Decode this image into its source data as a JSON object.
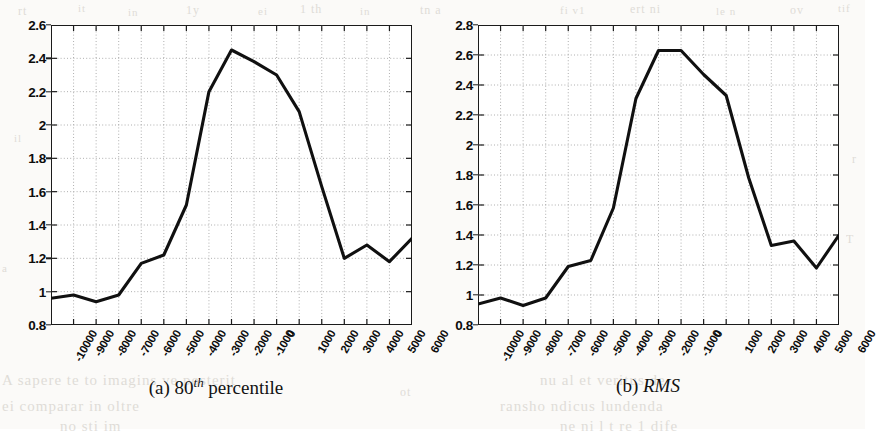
{
  "page": {
    "background_color": "#fbfaf8",
    "ink_color": "#1b1b1b",
    "grid_color": "#9a9a9a"
  },
  "ghost_text": [
    {
      "text": "rt",
      "x": 18,
      "y": 4,
      "size": 12
    },
    {
      "text": "it",
      "x": 78,
      "y": 2,
      "size": 11
    },
    {
      "text": "in",
      "x": 128,
      "y": 6,
      "size": 11
    },
    {
      "text": "1y",
      "x": 186,
      "y": 3,
      "size": 12
    },
    {
      "text": "ei",
      "x": 258,
      "y": 5,
      "size": 11
    },
    {
      "text": "1 th",
      "x": 300,
      "y": 2,
      "size": 12
    },
    {
      "text": "in",
      "x": 360,
      "y": 5,
      "size": 11
    },
    {
      "text": "tn a",
      "x": 420,
      "y": 3,
      "size": 12
    },
    {
      "text": "fi v1",
      "x": 560,
      "y": 4,
      "size": 11
    },
    {
      "text": "ert ni",
      "x": 630,
      "y": 2,
      "size": 12
    },
    {
      "text": "le n",
      "x": 716,
      "y": 5,
      "size": 11
    },
    {
      "text": "ov",
      "x": 790,
      "y": 3,
      "size": 12
    },
    {
      "text": "tif",
      "x": 838,
      "y": 2,
      "size": 11
    },
    {
      "text": "il",
      "x": 14,
      "y": 132,
      "size": 11
    },
    {
      "text": "1",
      "x": 336,
      "y": 120,
      "size": 11
    },
    {
      "text": "r",
      "x": 852,
      "y": 152,
      "size": 12
    },
    {
      "text": "1",
      "x": 592,
      "y": 122,
      "size": 11
    },
    {
      "text": "T",
      "x": 846,
      "y": 232,
      "size": 12
    },
    {
      "text": "a",
      "x": 2,
      "y": 262,
      "size": 11
    },
    {
      "text": "ot",
      "x": 400,
      "y": 385,
      "size": 12
    },
    {
      "text": "A sapere te to imagins ve posterit",
      "x": 2,
      "y": 372,
      "size": 15
    },
    {
      "text": "ei comparar in oltre",
      "x": 2,
      "y": 398,
      "size": 15
    },
    {
      "text": "nu al et veritus de",
      "x": 540,
      "y": 372,
      "size": 15
    },
    {
      "text": "ransho ndicus lundenda",
      "x": 500,
      "y": 398,
      "size": 15
    },
    {
      "text": "ne ni l t re 1 dife",
      "x": 560,
      "y": 418,
      "size": 15
    },
    {
      "text": "no sti im",
      "x": 60,
      "y": 418,
      "size": 15
    }
  ],
  "subfigures": [
    {
      "id": "a",
      "caption_prefix": "(a)",
      "caption_main": "80",
      "caption_sup": "th",
      "caption_suffix": "percentile",
      "caption_style": "mixed",
      "chart_data": {
        "type": "line",
        "title": "",
        "xlabel": "",
        "ylabel": "",
        "xlim": [
          -10000,
          6000
        ],
        "ylim": [
          0.8,
          2.6
        ],
        "ytick_values": [
          0.8,
          1,
          1.2,
          1.4,
          1.6,
          1.8,
          2,
          2.2,
          2.4,
          2.6
        ],
        "ytick_labels": [
          "0.8",
          "1",
          "1.2",
          "1.4",
          "1.6",
          "1.8",
          "2",
          "2.2",
          "2.4",
          "2.6"
        ],
        "xtick_values": [
          -10000,
          -9000,
          -8000,
          -7000,
          -6000,
          -5000,
          -4000,
          -3000,
          -2000,
          -1000,
          0,
          1000,
          2000,
          3000,
          4000,
          5000,
          6000
        ],
        "xtick_labels": [
          "-10000",
          "-9000",
          "-8000",
          "-7000",
          "-6000",
          "-5000",
          "-4000",
          "-3000",
          "-2000",
          "-1000",
          "0",
          "1000",
          "2000",
          "3000",
          "4000",
          "5000",
          "6000"
        ],
        "grid": true,
        "legend": null,
        "series": [
          {
            "name": "80th percentile",
            "color": "#101010",
            "x": [
              -10000,
              -9000,
              -8000,
              -7000,
              -6000,
              -5000,
              -4000,
              -3000,
              -2000,
              -1000,
              0,
              1000,
              2000,
              3000,
              4000,
              5000,
              6000
            ],
            "values": [
              0.96,
              0.98,
              0.94,
              0.98,
              1.17,
              1.22,
              1.52,
              2.2,
              2.45,
              2.38,
              2.3,
              2.08,
              1.63,
              1.2,
              1.28,
              1.18,
              1.32
            ]
          }
        ]
      }
    },
    {
      "id": "b",
      "caption_prefix": "(b)",
      "caption_main": "RMS",
      "caption_sup": "",
      "caption_suffix": "",
      "caption_style": "italic",
      "chart_data": {
        "type": "line",
        "title": "",
        "xlabel": "",
        "ylabel": "",
        "xlim": [
          -10000,
          6000
        ],
        "ylim": [
          0.8,
          2.8
        ],
        "ytick_values": [
          0.8,
          1,
          1.2,
          1.4,
          1.6,
          1.8,
          2,
          2.2,
          2.4,
          2.6,
          2.8
        ],
        "ytick_labels": [
          "0.8",
          "1",
          "1.2",
          "1.4",
          "1.6",
          "1.8",
          "2",
          "2.2",
          "2.4",
          "2.6",
          "2.8"
        ],
        "xtick_values": [
          -10000,
          -9000,
          -8000,
          -7000,
          -6000,
          -5000,
          -4000,
          -3000,
          -2000,
          -1000,
          0,
          1000,
          2000,
          3000,
          4000,
          5000,
          6000
        ],
        "xtick_labels": [
          "-10000",
          "-9000",
          "-8000",
          "-7000",
          "-6000",
          "-5000",
          "-4000",
          "-3000",
          "-2000",
          "-1000",
          "0",
          "1000",
          "2000",
          "3000",
          "4000",
          "5000",
          "6000"
        ],
        "grid": true,
        "legend": null,
        "series": [
          {
            "name": "RMS",
            "color": "#101010",
            "x": [
              -10000,
              -9000,
              -8000,
              -7000,
              -6000,
              -5000,
              -4000,
              -3000,
              -2000,
              -1000,
              0,
              1000,
              2000,
              3000,
              4000,
              5000,
              6000
            ],
            "values": [
              0.94,
              0.98,
              0.93,
              0.98,
              1.19,
              1.23,
              1.58,
              2.31,
              2.63,
              2.63,
              2.47,
              2.33,
              1.78,
              1.33,
              1.36,
              1.18,
              1.4
            ]
          }
        ]
      }
    }
  ]
}
